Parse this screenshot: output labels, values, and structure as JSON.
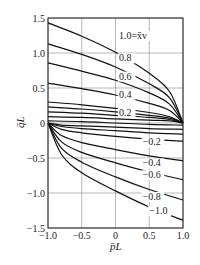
{
  "chart_data": {
    "type": "line",
    "title": "",
    "xlabel": "p̄L",
    "ylabel": "q̄L",
    "xlim": [
      -1.0,
      1.0
    ],
    "ylim": [
      -1.5,
      1.5
    ],
    "x_ticks": [
      "-1.0",
      "-0.5",
      "0",
      "0.5",
      "1.0"
    ],
    "y_ticks": [
      "1.5",
      "1.0",
      "0.5",
      "0",
      "-0.5",
      "-1.0",
      "-1.5"
    ],
    "grid": true,
    "legend": "inline labels",
    "parameter_name": "x̄v",
    "series": [
      {
        "name": "1.0",
        "label": "1.0=x̄v",
        "x": [
          -1.0,
          -0.5,
          0.0,
          0.5,
          0.8,
          1.0
        ],
        "y": [
          1.43,
          1.24,
          1.01,
          0.71,
          0.45,
          0.0
        ]
      },
      {
        "name": "0.8",
        "label": "0.8",
        "x": [
          -1.0,
          -0.5,
          0.0,
          0.5,
          0.8,
          1.0
        ],
        "y": [
          1.13,
          0.98,
          0.8,
          0.56,
          0.36,
          0.0
        ]
      },
      {
        "name": "0.6",
        "label": "0.6",
        "x": [
          -1.0,
          -0.5,
          0.0,
          0.5,
          0.8,
          1.0
        ],
        "y": [
          0.86,
          0.74,
          0.61,
          0.43,
          0.27,
          0.0
        ]
      },
      {
        "name": "0.4",
        "label": "0.4",
        "x": [
          -1.0,
          -0.5,
          0.0,
          0.5,
          0.8,
          1.0
        ],
        "y": [
          0.57,
          0.49,
          0.4,
          0.28,
          0.18,
          0.0
        ]
      },
      {
        "name": "0.2",
        "label": "0.2",
        "x": [
          -1.0,
          -0.5,
          0.0,
          0.5,
          0.8,
          1.0
        ],
        "y": [
          0.3,
          0.26,
          0.21,
          0.15,
          0.09,
          0.0
        ]
      },
      {
        "name": "0.15",
        "label": "",
        "x": [
          -1.0,
          -0.5,
          0.0,
          0.5,
          0.8,
          1.0
        ],
        "y": [
          0.23,
          0.2,
          0.16,
          0.11,
          0.07,
          0.0
        ]
      },
      {
        "name": "0.1",
        "label": "",
        "x": [
          -1.0,
          -0.5,
          0.0,
          0.5,
          0.8,
          1.0
        ],
        "y": [
          0.16,
          0.14,
          0.11,
          0.08,
          0.05,
          0.0
        ]
      },
      {
        "name": "0.05",
        "label": "",
        "x": [
          -1.0,
          -0.5,
          0.0,
          0.5,
          0.8,
          1.0
        ],
        "y": [
          0.09,
          0.08,
          0.06,
          0.04,
          0.03,
          0.0
        ]
      },
      {
        "name": "0",
        "label": "",
        "x": [
          -1.0,
          -0.5,
          0.0,
          0.5,
          1.0
        ],
        "y": [
          0.03,
          0.02,
          0.0,
          -0.02,
          -0.03
        ]
      },
      {
        "name": "-0.05",
        "label": "",
        "x": [
          -1.0,
          -0.8,
          -0.5,
          0.0,
          0.5,
          1.0
        ],
        "y": [
          0.0,
          -0.03,
          -0.04,
          -0.06,
          -0.08,
          -0.09
        ]
      },
      {
        "name": "-0.1",
        "label": "",
        "x": [
          -1.0,
          -0.8,
          -0.5,
          0.0,
          0.5,
          1.0
        ],
        "y": [
          0.0,
          -0.05,
          -0.08,
          -0.11,
          -0.14,
          -0.16
        ]
      },
      {
        "name": "-0.2",
        "label": "-0.2",
        "x": [
          -1.0,
          -0.8,
          -0.5,
          0.0,
          0.5,
          1.0
        ],
        "y": [
          0.0,
          -0.09,
          -0.14,
          -0.19,
          -0.23,
          -0.26
        ]
      },
      {
        "name": "-0.4",
        "label": "-0.4",
        "x": [
          -1.0,
          -0.8,
          -0.5,
          0.0,
          0.5,
          1.0
        ],
        "y": [
          0.0,
          -0.18,
          -0.28,
          -0.38,
          -0.47,
          -0.54
        ]
      },
      {
        "name": "-0.6",
        "label": "-0.6",
        "x": [
          -1.0,
          -0.8,
          -0.5,
          0.0,
          0.5,
          1.0
        ],
        "y": [
          0.0,
          -0.27,
          -0.42,
          -0.57,
          -0.7,
          -0.81
        ]
      },
      {
        "name": "-0.8",
        "label": "-0.8",
        "x": [
          -1.0,
          -0.8,
          -0.5,
          0.0,
          0.5,
          1.0
        ],
        "y": [
          0.0,
          -0.36,
          -0.56,
          -0.77,
          -0.95,
          -1.1
        ]
      },
      {
        "name": "-1.0",
        "label": "-1.0",
        "x": [
          -1.0,
          -0.8,
          -0.5,
          0.0,
          0.5,
          1.0
        ],
        "y": [
          0.0,
          -0.45,
          -0.71,
          -0.97,
          -1.2,
          -1.39
        ]
      }
    ],
    "annotations": [
      {
        "text": "1.0=x̄v",
        "x": 0.05,
        "y": 1.2
      },
      {
        "text": "0.8",
        "x": 0.05,
        "y": 0.88
      },
      {
        "text": "0.6",
        "x": 0.05,
        "y": 0.62
      },
      {
        "text": "0.4",
        "x": 0.05,
        "y": 0.36
      },
      {
        "text": "0.2",
        "x": 0.05,
        "y": 0.1
      },
      {
        "text": "-0.2",
        "x": 0.4,
        "y": -0.32
      },
      {
        "text": "-0.4",
        "x": 0.4,
        "y": -0.62
      },
      {
        "text": "-0.6",
        "x": 0.4,
        "y": -0.79
      },
      {
        "text": "-0.8",
        "x": 0.4,
        "y": -1.1
      },
      {
        "text": "-1.0",
        "x": 0.5,
        "y": -1.3
      }
    ]
  },
  "layout": {
    "plot_left": 48,
    "plot_right": 183,
    "plot_top": 18,
    "plot_bottom": 228,
    "line_color": "#111111",
    "grid_color": "#888888"
  }
}
